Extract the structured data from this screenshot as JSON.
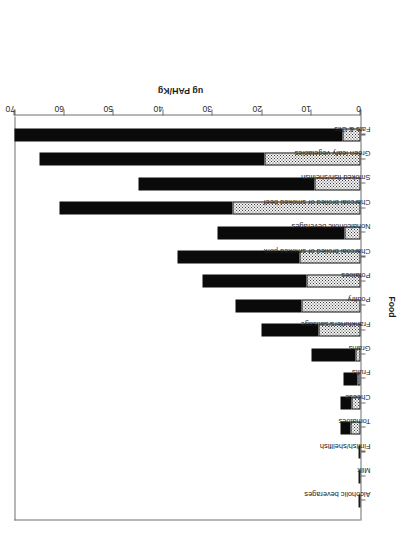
{
  "chart_data": {
    "type": "bar",
    "stacked": true,
    "title": "",
    "xlabel": "Food",
    "ylabel": "ug PAH/Kg",
    "ylim": [
      0,
      70
    ],
    "yticks": [
      0,
      10,
      20,
      30,
      40,
      50,
      60,
      70
    ],
    "ytick_labels": [
      "0",
      "10",
      "20",
      "30",
      "40",
      "50",
      "60",
      "70"
    ],
    "grid": false,
    "legend": "none",
    "categories": [
      "Alcoholic beverages",
      "Milk",
      "Finfish/shellfish",
      "Tomatoes",
      "Cheese",
      "Fruits",
      "Grains",
      "Frankfurters/sausage",
      "Poultry",
      "Potatoes",
      "Charcoal broiled or smoked pork",
      "Nonalcoholic beverages",
      "Charcoal broiled or smoked beef",
      "Smoked fish/shellfish",
      "Green leafy vegetables",
      "Fats & Oils"
    ],
    "series": [
      {
        "name": "lower-segment",
        "fill": "stippled",
        "color": "#f3f3f3",
        "values": [
          0.1,
          0.1,
          0.3,
          2.0,
          1.8,
          0.7,
          1.0,
          8.5,
          12.0,
          11.0,
          12.3,
          3.2,
          26.0,
          9.3,
          19.5,
          3.7
        ]
      },
      {
        "name": "upper-segment",
        "fill": "solid",
        "color": "#0a0a0a",
        "values": [
          0.0,
          0.0,
          0.1,
          2.0,
          2.2,
          2.8,
          9.0,
          11.5,
          13.3,
          21.0,
          24.7,
          25.8,
          35.0,
          35.7,
          45.5,
          66.3
        ]
      }
    ],
    "totals": [
      0.1,
      0.1,
      0.4,
      4.0,
      4.0,
      3.5,
      10.0,
      20.0,
      25.3,
      32.0,
      37.0,
      29.0,
      61.0,
      45.0,
      65.0,
      70.0
    ]
  }
}
